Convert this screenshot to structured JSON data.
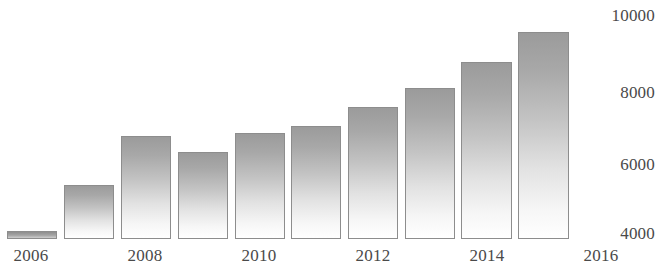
{
  "chart_data": {
    "type": "bar",
    "title": "",
    "xlabel": "",
    "ylabel": "",
    "categories": [
      "2006",
      "2007",
      "2008",
      "2009",
      "2010",
      "2011",
      "2012",
      "2013",
      "2014",
      "2015"
    ],
    "values": [
      4055,
      5320,
      6670,
      6230,
      6750,
      6940,
      7470,
      7990,
      8705,
      9530
    ],
    "ylim": [
      4000,
      10000
    ],
    "xlim": [
      "2006",
      "2016"
    ],
    "y_ticks": [
      "10000",
      "8000",
      "6000",
      "4000"
    ],
    "y_tick_values": [
      10000,
      8000,
      6000,
      4000
    ],
    "x_ticks": [
      "2006",
      "2008",
      "2010",
      "2012",
      "2014",
      "2016"
    ],
    "x_tick_values": [
      2006,
      2008,
      2010,
      2012,
      2014,
      2016
    ],
    "grid": false,
    "legend": null,
    "bar_fill_top_color": "#9b9b9b",
    "bar_fill_bottom_color": "#ffffff",
    "bar_border_color": "#8d8d8d",
    "text_color": "#4a4a4a",
    "background_color": "#ffffff"
  },
  "axes": {
    "y_labels": [
      {
        "text": "10000",
        "top": 6
      },
      {
        "text": "8000",
        "top": 83
      },
      {
        "text": "6000",
        "top": 155
      },
      {
        "text": "4000",
        "top": 224
      }
    ],
    "x_labels": [
      {
        "text": "2006",
        "left": 31
      },
      {
        "text": "2008",
        "left": 145
      },
      {
        "text": "2010",
        "left": 259
      },
      {
        "text": "2012",
        "left": 373
      },
      {
        "text": "2014",
        "left": 487
      },
      {
        "text": "2016",
        "left": 601
      }
    ]
  },
  "bars": [
    {
      "year": "2006",
      "value": 4055,
      "left": 7,
      "width": 50,
      "top": 231,
      "height": 8
    },
    {
      "year": "2007",
      "value": 5320,
      "left": 64,
      "width": 50,
      "top": 185,
      "height": 54
    },
    {
      "year": "2008",
      "value": 6670,
      "left": 121,
      "width": 50,
      "top": 136,
      "height": 103
    },
    {
      "year": "2009",
      "value": 6230,
      "left": 178,
      "width": 50,
      "top": 152,
      "height": 87
    },
    {
      "year": "2010",
      "value": 6750,
      "left": 235,
      "width": 50,
      "top": 133,
      "height": 106
    },
    {
      "year": "2011",
      "value": 6940,
      "left": 291,
      "width": 50,
      "top": 126,
      "height": 113
    },
    {
      "year": "2012",
      "value": 7470,
      "left": 348,
      "width": 50,
      "top": 107,
      "height": 132
    },
    {
      "year": "2013",
      "value": 7990,
      "left": 405,
      "width": 50,
      "top": 88,
      "height": 151
    },
    {
      "year": "2014",
      "value": 8705,
      "left": 461,
      "width": 51,
      "top": 62,
      "height": 177
    },
    {
      "year": "2015",
      "value": 9530,
      "left": 518,
      "width": 51,
      "top": 32,
      "height": 207
    }
  ]
}
